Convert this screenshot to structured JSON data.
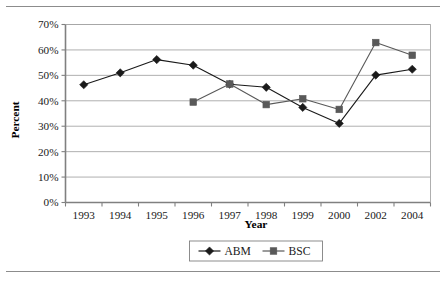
{
  "chart_data": {
    "type": "line",
    "title": "",
    "xlabel": "Year",
    "ylabel": "Percent",
    "categories": [
      "1993",
      "1994",
      "1995",
      "1996",
      "1997",
      "1998",
      "1999",
      "2000",
      "2002",
      "2004"
    ],
    "ylim": [
      0,
      70
    ],
    "ytick_step": 10,
    "ytick_labels": [
      "0%",
      "10%",
      "20%",
      "30%",
      "40%",
      "50%",
      "60%",
      "70%"
    ],
    "ytick_values": [
      0,
      10,
      20,
      30,
      40,
      50,
      60,
      70
    ],
    "grid": "horizontal",
    "legend_position": "bottom-center",
    "series": [
      {
        "name": "ABM",
        "marker": "diamond",
        "color": "#1a1a1a",
        "values": [
          46.3,
          51.0,
          56.2,
          54.0,
          46.5,
          45.3,
          37.4,
          31.1,
          50.1,
          52.4
        ]
      },
      {
        "name": "BSC",
        "marker": "square",
        "color": "#595959",
        "values": [
          null,
          null,
          null,
          39.5,
          46.6,
          38.5,
          40.8,
          36.6,
          62.9,
          57.9
        ]
      }
    ]
  },
  "axis": {
    "y_title": "Percent",
    "x_title": "Year"
  },
  "legend": {
    "items": [
      {
        "label": "ABM",
        "marker": "diamond"
      },
      {
        "label": "BSC",
        "marker": "square"
      }
    ]
  },
  "colors": {
    "abm": "#1a1a1a",
    "bsc": "#595959",
    "grid": "#a6a6a6",
    "axis": "#808080",
    "rule": "#8c8c8c",
    "background": "#ffffff"
  }
}
